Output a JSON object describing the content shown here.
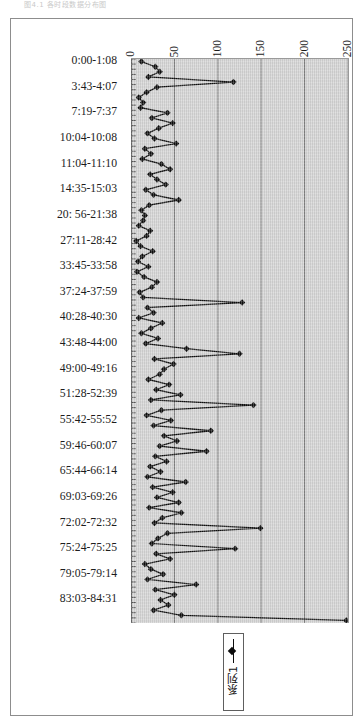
{
  "page": {
    "header_text": "图4.1  各时段数据分布图"
  },
  "chart": {
    "legend": {
      "series_label": "系列1",
      "marker": "diamond-line-marker"
    }
  },
  "chart_data": {
    "type": "line",
    "orientation": "rotated-90",
    "title": "",
    "xlabel": "",
    "ylabel": "",
    "grid": true,
    "legend_position": "bottom",
    "value_axis": {
      "ticks": [
        0,
        50,
        100,
        150,
        200,
        250
      ],
      "lim": [
        0,
        250
      ]
    },
    "category_axis": {
      "visible_tick_labels": [
        "0:00-1:08",
        "3:43-4:07",
        "7:19-7:37",
        "10:04-10:08",
        "11:04-11:10",
        "14:35-15:03",
        "20: 56-21:38",
        "27:11-28:42",
        "33:45-33:58",
        "37:24-37:59",
        "40:28-40:30",
        "43:48-44:00",
        "49:00-49:16",
        "51:28-52:39",
        "55:42-55:52",
        "59:46-60:07",
        "65:44-66:14",
        "69:03-69:26",
        "72:02-72:32",
        "75:24-75:25",
        "79:05-79:14",
        "83:03-84:31"
      ],
      "label_interval": 5,
      "total_points": 110
    },
    "series": [
      {
        "name": "系列1",
        "values": [
          12,
          28,
          33,
          20,
          118,
          30,
          18,
          9,
          14,
          11,
          42,
          24,
          48,
          32,
          19,
          27,
          52,
          16,
          23,
          13,
          35,
          45,
          22,
          30,
          40,
          17,
          26,
          55,
          21,
          12,
          16,
          14,
          9,
          22,
          18,
          6,
          11,
          25,
          13,
          8,
          20,
          7,
          15,
          30,
          24,
          10,
          14,
          128,
          19,
          26,
          9,
          36,
          23,
          12,
          31,
          17,
          64,
          125,
          27,
          49,
          38,
          33,
          20,
          44,
          29,
          57,
          23,
          141,
          35,
          18,
          46,
          26,
          92,
          38,
          53,
          33,
          87,
          28,
          41,
          22,
          34,
          19,
          63,
          25,
          48,
          30,
          55,
          21,
          58,
          36,
          27,
          149,
          42,
          31,
          24,
          120,
          29,
          45,
          16,
          23,
          37,
          19,
          75,
          28,
          50,
          34,
          43,
          26,
          58,
          248
        ]
      }
    ]
  }
}
